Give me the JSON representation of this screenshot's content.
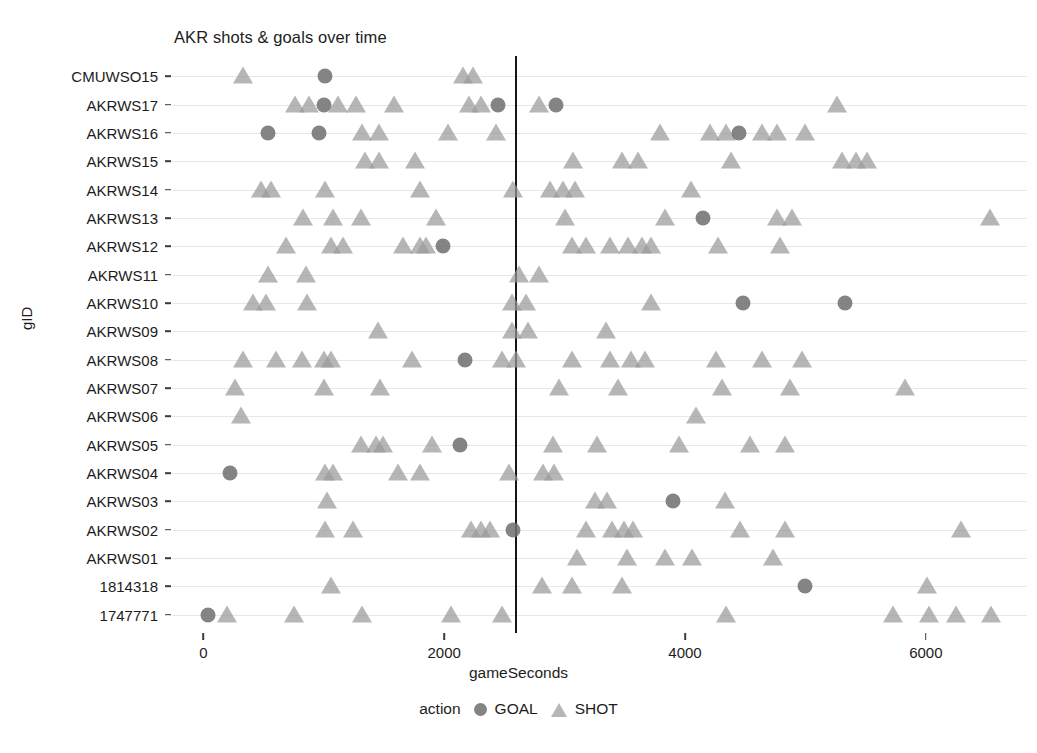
{
  "chart_data": {
    "type": "scatter",
    "title": "AKR shots & goals over time",
    "xlabel": "gameSeconds",
    "ylabel": "gID",
    "xlim": [
      -260,
      6840
    ],
    "xticks": [
      0,
      2000,
      4000,
      6000
    ],
    "xtick_labels": [
      "0",
      "2000",
      "4000",
      "6000"
    ],
    "grid": "horizontal",
    "legend": {
      "title": "action",
      "position": "bottom",
      "entries": [
        {
          "label": "GOAL",
          "marker": "circle",
          "color": "#707070"
        },
        {
          "label": "SHOT",
          "marker": "triangle",
          "color": "#9a9a9a"
        }
      ]
    },
    "annotations": [
      {
        "type": "vline",
        "x": 2585,
        "color": "#15151a"
      }
    ],
    "categories": [
      "CMUWSO15",
      "AKRWS17",
      "AKRWS16",
      "AKRWS15",
      "AKRWS14",
      "AKRWS13",
      "AKRWS12",
      "AKRWS11",
      "AKRWS10",
      "AKRWS09",
      "AKRWS08",
      "AKRWS07",
      "AKRWS06",
      "AKRWS05",
      "AKRWS04",
      "AKRWS03",
      "AKRWS02",
      "AKRWS01",
      "1814318",
      "1747771"
    ],
    "series": [
      {
        "gID": "CMUWSO15",
        "SHOT": [
          330,
          2155,
          2240
        ],
        "GOAL": [
          1010
        ]
      },
      {
        "gID": "AKRWS17",
        "SHOT": [
          760,
          880,
          1120,
          1270,
          1580,
          2210,
          2310,
          2790,
          5260
        ],
        "GOAL": [
          1000,
          2450,
          2930
        ]
      },
      {
        "gID": "AKRWS16",
        "SHOT": [
          1320,
          1460,
          2030,
          2430,
          3790,
          4210,
          4340,
          4640,
          4760,
          5000
        ],
        "GOAL": [
          540,
          960,
          4450
        ]
      },
      {
        "gID": "AKRWS15",
        "SHOT": [
          1340,
          1460,
          1760,
          3070,
          3480,
          3610,
          4380,
          5300,
          5420,
          5510
        ],
        "GOAL": []
      },
      {
        "gID": "AKRWS14",
        "SHOT": [
          480,
          560,
          1010,
          1800,
          2570,
          2880,
          2990,
          3090,
          4050
        ],
        "GOAL": []
      },
      {
        "gID": "AKRWS13",
        "SHOT": [
          830,
          1080,
          1310,
          1930,
          3000,
          3830,
          4760,
          4890,
          6530
        ],
        "GOAL": [
          4150
        ]
      },
      {
        "gID": "AKRWS12",
        "SHOT": [
          690,
          1060,
          1160,
          1660,
          1800,
          1850,
          3060,
          3180,
          3380,
          3530,
          3640,
          3720,
          4270,
          4790
        ],
        "GOAL": [
          1990
        ]
      },
      {
        "gID": "AKRWS11",
        "SHOT": [
          540,
          850,
          2620,
          2790
        ],
        "GOAL": []
      },
      {
        "gID": "AKRWS10",
        "SHOT": [
          410,
          520,
          860,
          2560,
          2680,
          3720
        ],
        "GOAL": [
          4480,
          5330
        ]
      },
      {
        "gID": "AKRWS09",
        "SHOT": [
          1450,
          2560,
          2700,
          3340
        ],
        "GOAL": []
      },
      {
        "gID": "AKRWS08",
        "SHOT": [
          330,
          600,
          820,
          1000,
          1060,
          1730,
          2480,
          2600,
          3060,
          3380,
          3550,
          3670,
          4260,
          4640,
          4970
        ],
        "GOAL": [
          2170
        ]
      },
      {
        "gID": "AKRWS07",
        "SHOT": [
          260,
          1000,
          1470,
          2950,
          3440,
          4310,
          4870,
          5830
        ],
        "GOAL": []
      },
      {
        "gID": "AKRWS06",
        "SHOT": [
          310,
          4090
        ],
        "GOAL": []
      },
      {
        "gID": "AKRWS05",
        "SHOT": [
          1310,
          1430,
          1490,
          1900,
          2900,
          3270,
          3950,
          4540,
          4830
        ],
        "GOAL": [
          2130
        ]
      },
      {
        "gID": "AKRWS04",
        "SHOT": [
          1010,
          1080,
          1620,
          1800,
          2540,
          2820,
          2910
        ],
        "GOAL": [
          220
        ]
      },
      {
        "gID": "AKRWS03",
        "SHOT": [
          1030,
          3250,
          3350,
          4330
        ],
        "GOAL": [
          3900
        ]
      },
      {
        "gID": "AKRWS02",
        "SHOT": [
          1010,
          1240,
          2220,
          2310,
          2380,
          3180,
          3390,
          3490,
          3570,
          4460,
          4830,
          6290
        ],
        "GOAL": [
          2570
        ]
      },
      {
        "gID": "AKRWS01",
        "SHOT": [
          3100,
          3520,
          3830,
          4060,
          4730
        ],
        "GOAL": []
      },
      {
        "gID": "1814318",
        "SHOT": [
          1060,
          2810,
          3060,
          3480,
          6010
        ],
        "GOAL": [
          5000
        ]
      },
      {
        "gID": "1747771",
        "SHOT": [
          200,
          750,
          1320,
          2060,
          2480,
          4340,
          5730,
          6030,
          6250,
          6540
        ],
        "GOAL": [
          40
        ]
      }
    ]
  }
}
